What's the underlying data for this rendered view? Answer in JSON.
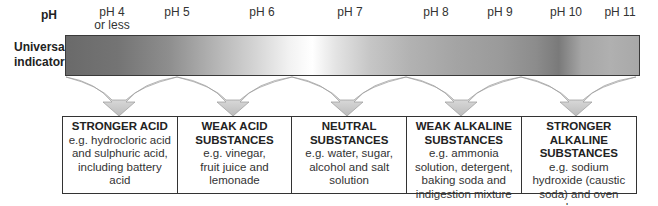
{
  "header": {
    "ph_label": "pH",
    "indicator_label_line1": "Universal",
    "indicator_label_line2": "indicator"
  },
  "ph_scale": [
    {
      "line1": "pH 4",
      "line2": "or less",
      "x": 112
    },
    {
      "line1": "pH 5",
      "line2": "",
      "x": 177
    },
    {
      "line1": "pH 6",
      "line2": "",
      "x": 262
    },
    {
      "line1": "pH 7",
      "line2": "",
      "x": 350
    },
    {
      "line1": "pH 8",
      "line2": "",
      "x": 436
    },
    {
      "line1": "pH 9",
      "line2": "",
      "x": 500
    },
    {
      "line1": "pH 10",
      "line2": "",
      "x": 566
    },
    {
      "line1": "pH 11",
      "line2": "",
      "x": 620
    }
  ],
  "categories": [
    {
      "title": "STRONGER ACID",
      "desc": "e.g. hydrocloric acid and sulphuric acid, including battery acid"
    },
    {
      "title": "WEAK ACID SUBSTANCES",
      "desc": "e.g. vinegar, fruit juice and lemonade"
    },
    {
      "title": "NEUTRAL SUBSTANCES",
      "desc": "e.g. water, sugar, alcohol and salt solution"
    },
    {
      "title": "WEAK ALKALINE SUBSTANCES",
      "desc": "e.g. ammonia solution, detergent, baking soda and indigestion mixture"
    },
    {
      "title": "STRONGER ALKALINE SUBSTANCES",
      "desc": "e.g. sodium hydroxide (caustic soda) and oven cleaner"
    }
  ],
  "colors": {
    "border": "#333333",
    "arrow_fill_top": "#ffffff",
    "arrow_fill_bottom": "#bdbdbd"
  }
}
